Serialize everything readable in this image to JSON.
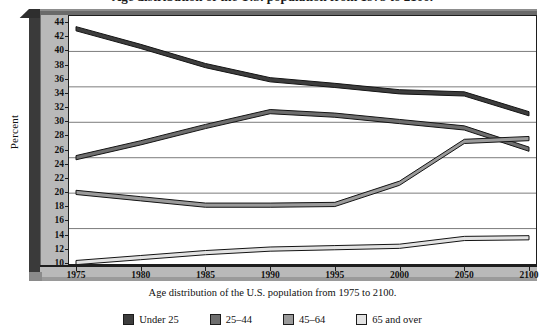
{
  "top_title": "Age distribution of the U.S. population from 1975 to 2100.",
  "axis": {
    "ylabel": "Percent",
    "yticks": [
      10,
      12,
      14,
      16,
      18,
      20,
      22,
      24,
      26,
      28,
      30,
      32,
      34,
      36,
      38,
      40,
      42,
      44
    ],
    "gridline_values": [
      15,
      20,
      25,
      30,
      35,
      40
    ],
    "xticks": [
      "1975",
      "1980",
      "1985",
      "1990",
      "1995",
      "2000",
      "2050",
      "2100"
    ]
  },
  "caption": "Age distribution of the U.S. population from 1975 to 2100.",
  "legend": {
    "items": [
      {
        "label": "Under 25",
        "color": "#3d3d3d"
      },
      {
        "label": "25–44",
        "color": "#6e6e6e"
      },
      {
        "label": "45–64",
        "color": "#9a9a9a"
      },
      {
        "label": "65 and over",
        "color": "#e2e2e2"
      }
    ]
  },
  "chart_data": {
    "type": "line",
    "title": "Age distribution of the U.S. population from 1975 to 2100.",
    "xlabel": "",
    "ylabel": "Percent",
    "x": [
      "1975",
      "1980",
      "1985",
      "1990",
      "1995",
      "2000",
      "2050",
      "2100"
    ],
    "ylim": [
      10,
      45
    ],
    "ytick_step": 2,
    "grid": true,
    "legend_position": "bottom",
    "series": [
      {
        "name": "Under 25",
        "color": "#3d3d3d",
        "values": [
          43.5,
          41.0,
          38.3,
          36.3,
          35.5,
          34.6,
          34.3,
          31.5
        ]
      },
      {
        "name": "25–44",
        "color": "#6e6e6e",
        "values": [
          25.3,
          27.4,
          29.7,
          31.8,
          31.3,
          30.4,
          29.5,
          26.5
        ]
      },
      {
        "name": "45–64",
        "color": "#9a9a9a",
        "values": [
          20.4,
          19.5,
          18.6,
          18.6,
          18.7,
          21.7,
          27.6,
          28.0
        ]
      },
      {
        "name": "65 and over",
        "color": "#e2e2e2",
        "values": [
          10.5,
          11.2,
          11.9,
          12.4,
          12.6,
          12.8,
          13.9,
          14.0
        ]
      }
    ]
  }
}
